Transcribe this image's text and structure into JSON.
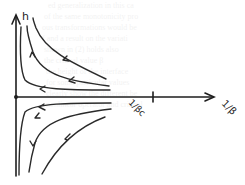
{
  "diagram": {
    "y_axis": {
      "label": "h"
    },
    "x_axis": {
      "label": "1/β",
      "tick_label": "1/βc"
    },
    "origin_marker": "filled-dot",
    "trajectories_upper": [
      {
        "id": "upper-outer",
        "direction": "toward-h-axis-then-up"
      },
      {
        "id": "upper-middle",
        "direction": "toward-h-axis-then-up"
      },
      {
        "id": "upper-inner",
        "direction": "toward-h-axis"
      }
    ],
    "trajectories_lower": [
      {
        "id": "lower-inner",
        "direction": "toward-h-axis"
      },
      {
        "id": "lower-middle",
        "direction": "toward-h-axis-then-down"
      },
      {
        "id": "lower-outer",
        "direction": "toward-h-axis-then-down"
      }
    ],
    "style": "hand-drawn pencil sketch"
  }
}
